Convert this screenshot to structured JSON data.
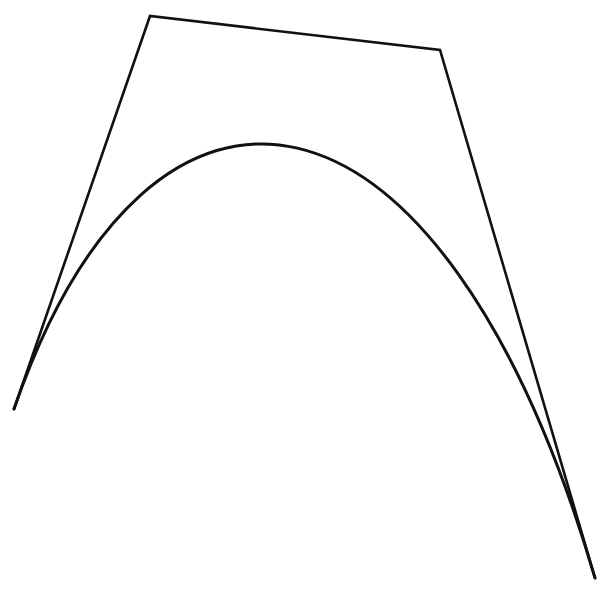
{
  "diagram": {
    "type": "cubic-bezier-with-control-polygon",
    "background": "#ffffff",
    "stroke_color": "#111111",
    "control_points": [
      {
        "x": 14,
        "y": 409
      },
      {
        "x": 150,
        "y": 16
      },
      {
        "x": 440,
        "y": 50
      },
      {
        "x": 595,
        "y": 578
      }
    ],
    "control_polygon": {
      "stroke_width": 2.6
    },
    "curve": {
      "stroke_width": 3
    }
  }
}
